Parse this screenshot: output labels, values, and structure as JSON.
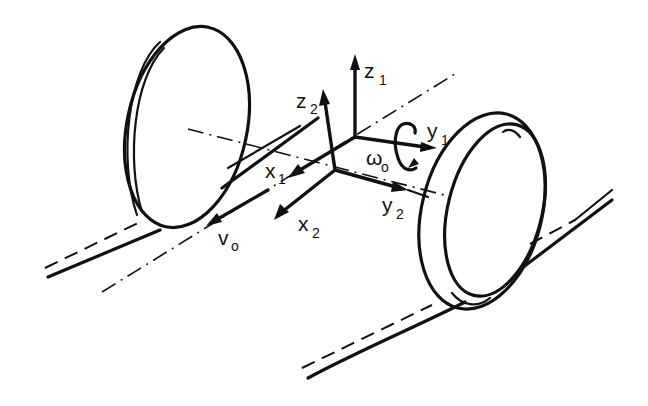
{
  "figure": {
    "labels": {
      "z1": {
        "base": "z",
        "sub": "1"
      },
      "y1": {
        "base": "y",
        "sub": "1"
      },
      "x1": {
        "base": "x",
        "sub": "1"
      },
      "z2": {
        "base": "z",
        "sub": "2"
      },
      "y2": {
        "base": "y",
        "sub": "2"
      },
      "x2": {
        "base": "x",
        "sub": "2"
      },
      "omega0": {
        "base": "ω",
        "sub": "o"
      },
      "v0": {
        "base": "v",
        "sub": "o"
      }
    },
    "colors": {
      "ink": "#111111",
      "background": "#ffffff"
    }
  }
}
